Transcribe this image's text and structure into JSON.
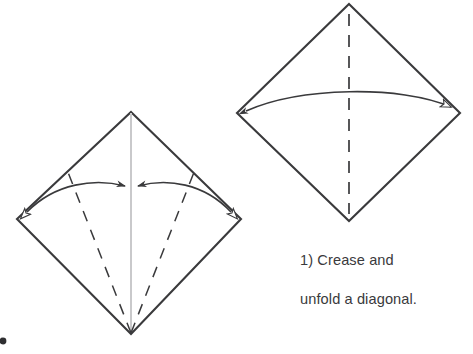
{
  "figure": {
    "kind": "origami-fold-instruction",
    "background_color": "#ffffff",
    "ink_color": "#3a3a3c",
    "crease_line_color": "#c9c9cb",
    "width": 473,
    "height": 354,
    "title_text": "",
    "step_number": "1)",
    "caption_line_1": "1) Crease and",
    "caption_line_2": "unfold a diagonal.",
    "caption_full": "1) Crease and unfold a diagonal."
  },
  "panels": [
    {
      "id": "panel-before",
      "label": "left-square-folding",
      "position": "left",
      "description": "Square rotated 45 degrees with vertical center crease line and two dashed fold lines converging at the bottom vertex; curved double arrows sweep from left and right vertices inward to the center.",
      "vertices": {
        "top": [
          131,
          112
        ],
        "right": [
          241,
          219
        ],
        "bottom": [
          131,
          334
        ],
        "left": [
          17,
          219
        ]
      },
      "center_line": {
        "type": "solid-crease",
        "from": [
          131,
          112
        ],
        "to": [
          131,
          334
        ],
        "color": "#c9c9cb"
      },
      "fold_lines": [
        {
          "type": "dashed",
          "from": [
            131,
            334
          ],
          "to": [
            68,
            172
          ]
        },
        {
          "type": "dashed",
          "from": [
            131,
            334
          ],
          "to": [
            194,
            172
          ]
        }
      ],
      "arrows": [
        {
          "id": "arrow-left-to-center",
          "start": [
            26,
            213
          ],
          "end": [
            127,
            186
          ],
          "start_head": "hollow",
          "end_head": "filled",
          "curve": "arc-upward"
        },
        {
          "id": "arrow-right-to-center",
          "start": [
            232,
            213
          ],
          "end": [
            136,
            186
          ],
          "start_head": "hollow",
          "end_head": "filled",
          "curve": "arc-upward"
        }
      ]
    },
    {
      "id": "panel-after",
      "label": "right-square-unfolded",
      "position": "right",
      "description": "Square rotated 45 degrees with a vertical dashed crease line and one curved double-headed horizontal arrow spanning left vertex to right vertex.",
      "vertices": {
        "top": [
          349,
          4
        ],
        "right": [
          460,
          113
        ],
        "bottom": [
          349,
          221
        ],
        "left": [
          237,
          113
        ]
      },
      "center_line": {
        "type": "dashed-crease",
        "from": [
          349,
          4
        ],
        "to": [
          349,
          221
        ],
        "color": "#3a3a3c"
      },
      "fold_lines": [],
      "arrows": [
        {
          "id": "arrow-span-diagonal",
          "start": [
            245,
            111
          ],
          "end": [
            452,
            107
          ],
          "start_head": "filled",
          "end_head": "hollow",
          "curve": "arc-upward"
        }
      ]
    }
  ],
  "marks": [
    {
      "id": "edge-artifact",
      "shape": "small-dark-dot",
      "position": [
        3,
        341
      ],
      "color": "#2f2f31"
    }
  ]
}
